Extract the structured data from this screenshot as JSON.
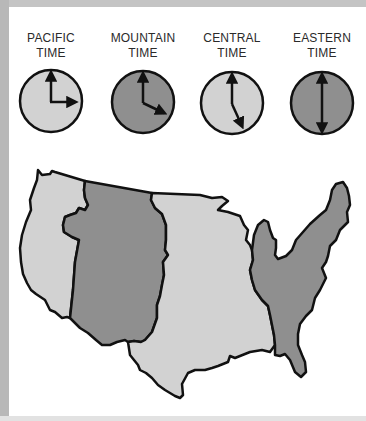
{
  "colors": {
    "light_zone": "#d2d2d2",
    "dark_zone": "#8f8f8f",
    "outline": "#111111",
    "frame": "#b8b8b8"
  },
  "zones": [
    {
      "id": "pacific",
      "line1": "PACIFIC",
      "line2": "TIME",
      "clock_time": "3:00",
      "shade": "light"
    },
    {
      "id": "mountain",
      "line1": "MOUNTAIN",
      "line2": "TIME",
      "clock_time": "4:00",
      "shade": "dark"
    },
    {
      "id": "central",
      "line1": "CENTRAL",
      "line2": "TIME",
      "clock_time": "5:00",
      "shade": "light"
    },
    {
      "id": "eastern",
      "line1": "EASTERN",
      "line2": "TIME",
      "clock_time": "6:00",
      "shade": "dark"
    }
  ],
  "map": {
    "title": "U.S. time zones map",
    "regions": [
      "Pacific",
      "Mountain",
      "Central",
      "Eastern"
    ]
  }
}
